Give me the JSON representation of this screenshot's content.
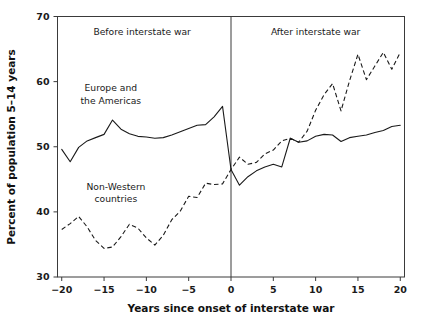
{
  "chart_data": {
    "type": "line",
    "title": "",
    "xlabel": "Years since onset of interstate war",
    "ylabel": "Percent of population 5–14 years",
    "xlim": [
      -20.5,
      20.5
    ],
    "ylim": [
      30,
      70
    ],
    "xticks": [
      -20,
      -15,
      -10,
      -5,
      0,
      5,
      10,
      15,
      20
    ],
    "xtick_labels": [
      "−20",
      "−15",
      "−10",
      "−5",
      "0",
      "5",
      "10",
      "15",
      "20"
    ],
    "yticks": [
      30,
      40,
      50,
      60,
      70
    ],
    "ytick_labels": [
      "30",
      "40",
      "50",
      "60",
      "70"
    ],
    "grid": false,
    "legend_position": "inline-annotation",
    "annotations": [
      {
        "name": "before-war-label",
        "text": "Before interstate war",
        "x": -10.5,
        "y": 67.2
      },
      {
        "name": "after-war-label",
        "text": "After interstate war",
        "x": 10.0,
        "y": 67.2
      },
      {
        "name": "series-label-europe-line1",
        "text": "Europe and",
        "x": -14.2,
        "y": 58.5
      },
      {
        "name": "series-label-europe-line2",
        "text": "the Americas",
        "x": -14.2,
        "y": 56.6
      },
      {
        "name": "series-label-nonwestern-line1",
        "text": "Non-Western",
        "x": -13.6,
        "y": 43.4
      },
      {
        "name": "series-label-nonwestern-line2",
        "text": "countries",
        "x": -13.6,
        "y": 41.5
      }
    ],
    "reference_line": {
      "name": "war-onset-divider",
      "x": 0,
      "label": "0"
    },
    "x": [
      -20,
      -19,
      -18,
      -17,
      -16,
      -15,
      -14,
      -13,
      -12,
      -11,
      -10,
      -9,
      -8,
      -7,
      -6,
      -5,
      -4,
      -3,
      -2,
      -1,
      0,
      1,
      2,
      3,
      4,
      5,
      6,
      7,
      8,
      9,
      10,
      11,
      12,
      13,
      14,
      15,
      16,
      17,
      18,
      19,
      20
    ],
    "series": [
      {
        "name": "Europe and the Americas",
        "style": "solid",
        "values": [
          49.6,
          47.7,
          49.9,
          50.9,
          51.4,
          51.9,
          54.1,
          52.7,
          52.0,
          51.6,
          51.5,
          51.3,
          51.4,
          51.8,
          52.3,
          52.8,
          53.3,
          53.4,
          54.6,
          56.2,
          46.5,
          44.1,
          45.4,
          46.3,
          46.9,
          47.3,
          46.9,
          51.3,
          50.7,
          50.9,
          51.6,
          51.9,
          51.8,
          50.8,
          51.4,
          51.6,
          51.8,
          52.2,
          52.5,
          53.1,
          53.3
        ]
      },
      {
        "name": "Non-Western countries",
        "style": "dashed",
        "values": [
          37.3,
          38.2,
          39.3,
          37.7,
          35.6,
          34.4,
          34.6,
          36.2,
          38.1,
          37.5,
          36.0,
          34.9,
          36.4,
          38.8,
          40.1,
          42.4,
          42.2,
          44.4,
          44.2,
          44.3,
          46.5,
          48.4,
          47.3,
          47.6,
          48.9,
          49.5,
          50.9,
          51.3,
          50.7,
          52.4,
          55.6,
          58.0,
          59.7,
          55.5,
          60.1,
          64.2,
          60.3,
          62.4,
          64.5,
          61.9,
          64.5
        ]
      }
    ]
  }
}
